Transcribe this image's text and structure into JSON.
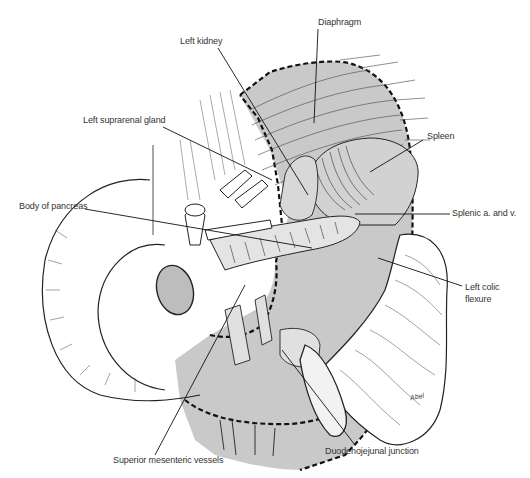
{
  "figure": {
    "type": "anatomical-illustration",
    "colors": {
      "shaded_region": "#c9c9c9",
      "line": "#222222",
      "label_text": "#333333",
      "background": "#ffffff"
    }
  },
  "labels": {
    "diaphragm": "Diaphragm",
    "left_kidney": "Left kidney",
    "left_suprarenal_gland": "Left suprarenal gland",
    "spleen": "Spleen",
    "body_of_pancreas": "Body of pancreas",
    "splenic_vessels": "Splenic a. and v.",
    "left_colic_flexure_1": "Left colic",
    "left_colic_flexure_2": "flexure",
    "superior_mesenteric_vessels": "Superior mesenteric vessels",
    "duodenojejunal_junction": "Duodenojejunal junction"
  },
  "signature": "Abel"
}
